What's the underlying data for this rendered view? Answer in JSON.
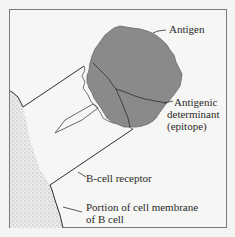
{
  "diagram": {
    "labels": {
      "antigen": "Antigen",
      "determinant_line1": "Antigenic",
      "determinant_line2": "determinant",
      "determinant_line3": "(epitope)",
      "receptor": "B-cell receptor",
      "membrane_line1": "Portion of cell membrane",
      "membrane_line2": "of B cell"
    },
    "colors": {
      "antigen_fill": "#8a8a8a",
      "line": "#2e2e2e",
      "membrane_stipple": "#9a9a9a",
      "frame": "#7a7a7a",
      "background": "#f6f6f4"
    }
  }
}
